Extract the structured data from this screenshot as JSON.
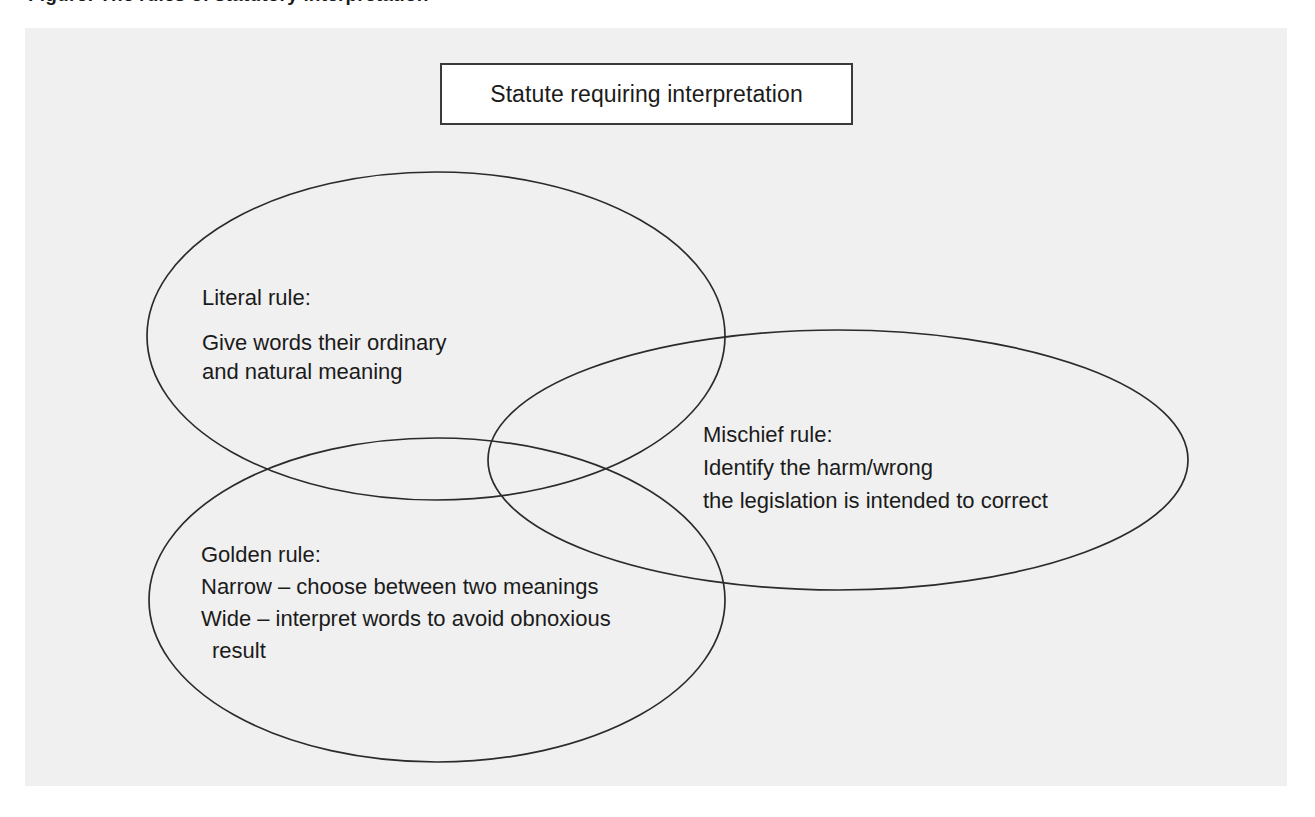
{
  "figure": {
    "kind": "venn-diagram",
    "caption_sliver": "Figure: The rules of statutory interpretation",
    "colors": {
      "page_background": "#ffffff",
      "panel_background": "#f0f0f0",
      "stroke": "#2b2b2b",
      "text": "#1b1b1b",
      "title_box_background": "#ffffff",
      "title_box_border": "#3a3a3a"
    }
  },
  "title_box": {
    "text": "Statute requiring interpretation"
  },
  "circles": [
    {
      "id": "literal",
      "name": "Literal rule",
      "heading": "Literal rule:",
      "lines": [
        "Give words their ordinary",
        "and natural meaning"
      ]
    },
    {
      "id": "mischief",
      "name": "Mischief rule",
      "heading": "Mischief rule:",
      "lines": [
        "Identify the harm/wrong",
        "the legislation is intended to correct"
      ]
    },
    {
      "id": "golden",
      "name": "Golden rule",
      "heading": "Golden rule:",
      "lines": [
        "Narrow – choose between two meanings",
        "Wide – interpret words to avoid obnoxious",
        "result"
      ]
    }
  ]
}
